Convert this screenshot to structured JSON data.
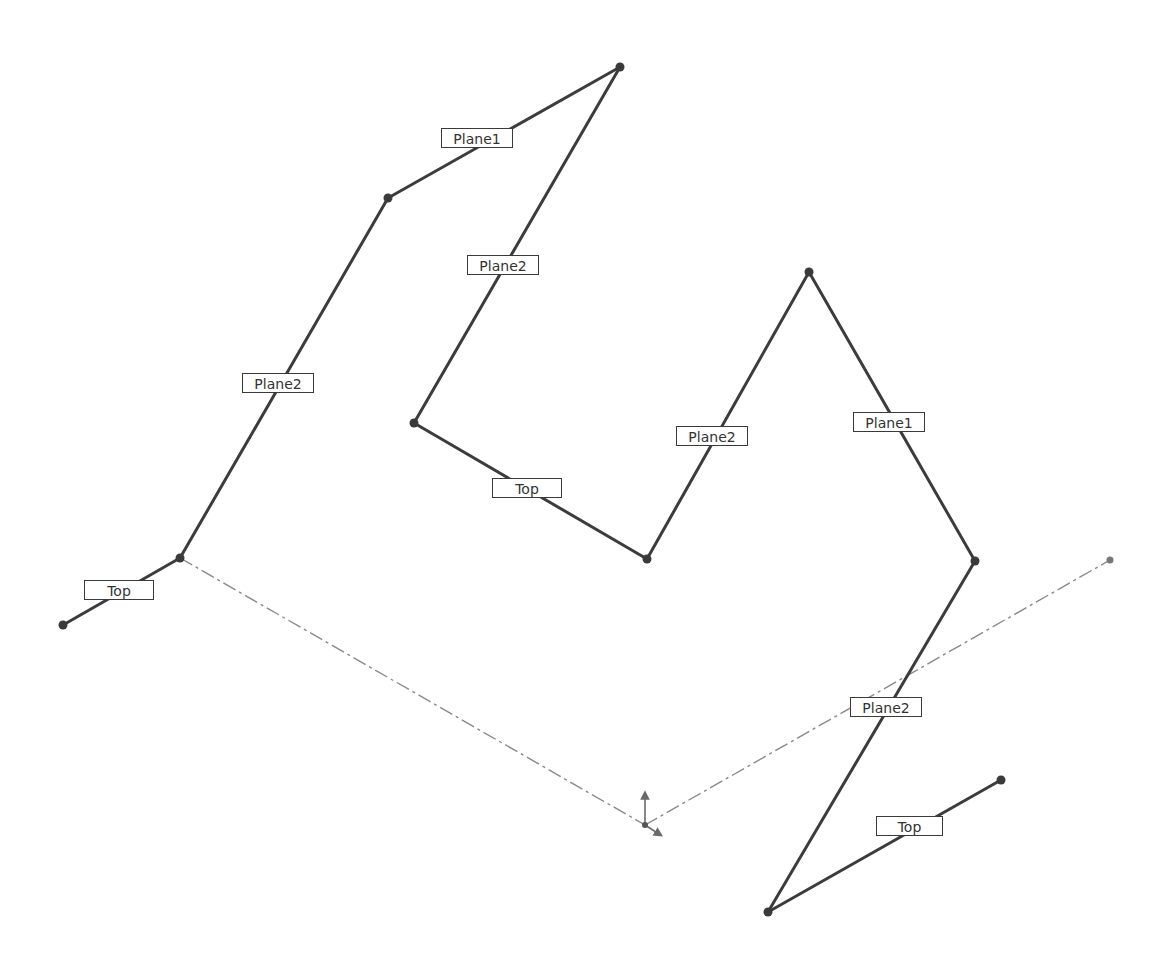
{
  "diagram": {
    "type": "3D sketch path with plane relation labels",
    "colors": {
      "segment": "#3c3c3c",
      "construction_line": "#8a8a8a",
      "label_border": "#3a3a3a",
      "label_text": "#333333",
      "origin_arrows": "#6a6a6a"
    },
    "points": [
      {
        "id": "p0",
        "x": 63,
        "y": 625
      },
      {
        "id": "p1",
        "x": 180,
        "y": 558
      },
      {
        "id": "p2",
        "x": 388,
        "y": 198
      },
      {
        "id": "p3",
        "x": 620,
        "y": 67
      },
      {
        "id": "p4",
        "x": 414,
        "y": 423
      },
      {
        "id": "p5",
        "x": 647,
        "y": 559
      },
      {
        "id": "p6",
        "x": 809,
        "y": 272
      },
      {
        "id": "p7",
        "x": 975,
        "y": 561
      },
      {
        "id": "p8",
        "x": 768,
        "y": 912
      },
      {
        "id": "p9",
        "x": 1001,
        "y": 780
      }
    ],
    "segments": [
      {
        "from": "p0",
        "to": "p1",
        "label": "Top",
        "label_x": 84,
        "label_y": 580,
        "label_w": 70
      },
      {
        "from": "p1",
        "to": "p2",
        "label": "Plane2",
        "label_x": 242,
        "label_y": 373,
        "label_w": 72
      },
      {
        "from": "p2",
        "to": "p3",
        "label": "Plane1",
        "label_x": 441,
        "label_y": 128,
        "label_w": 72
      },
      {
        "from": "p3",
        "to": "p4",
        "label": "Plane2",
        "label_x": 467,
        "label_y": 255,
        "label_w": 72
      },
      {
        "from": "p4",
        "to": "p5",
        "label": "Top",
        "label_x": 492,
        "label_y": 478,
        "label_w": 70
      },
      {
        "from": "p5",
        "to": "p6",
        "label": "Plane2",
        "label_x": 676,
        "label_y": 426,
        "label_w": 72
      },
      {
        "from": "p6",
        "to": "p7",
        "label": "Plane1",
        "label_x": 853,
        "label_y": 412,
        "label_w": 72
      },
      {
        "from": "p7",
        "to": "p8",
        "label": "Plane2",
        "label_x": 850,
        "label_y": 697,
        "label_w": 72
      },
      {
        "from": "p8",
        "to": "p9",
        "label": "Top",
        "label_x": 876,
        "label_y": 816,
        "label_w": 67
      }
    ],
    "construction_lines": [
      {
        "x1": 180,
        "y1": 558,
        "x2": 645,
        "y2": 825
      },
      {
        "x1": 645,
        "y1": 825,
        "x2": 1110,
        "y2": 560
      }
    ],
    "construction_endpoint": {
      "x": 1110,
      "y": 560
    },
    "origin": {
      "x": 645,
      "y": 825
    }
  }
}
